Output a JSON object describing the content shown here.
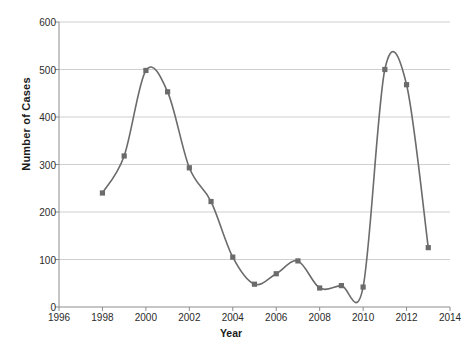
{
  "chart_data": {
    "type": "line",
    "title": "",
    "xlabel": "Year",
    "ylabel": "Number of Cases",
    "x": [
      1998,
      1999,
      2000,
      2001,
      2002,
      2003,
      2004,
      2005,
      2006,
      2007,
      2008,
      2009,
      2010,
      2011,
      2012,
      2013
    ],
    "values": [
      240,
      318,
      498,
      453,
      293,
      222,
      105,
      48,
      70,
      97,
      40,
      45,
      42,
      500,
      468,
      125
    ],
    "series": [
      {
        "name": "Number of Cases",
        "values": [
          240,
          318,
          498,
          453,
          293,
          222,
          105,
          48,
          70,
          97,
          40,
          45,
          42,
          500,
          468,
          125
        ]
      }
    ],
    "xlim": [
      1996,
      2014
    ],
    "ylim": [
      0,
      600
    ],
    "xticks": [
      1996,
      1998,
      2000,
      2002,
      2004,
      2006,
      2008,
      2010,
      2012,
      2014
    ],
    "xtick_labels": [
      "1996",
      "1998",
      "2000",
      "2002",
      "2004",
      "2006",
      "2008",
      "2010",
      "2012",
      "2014"
    ],
    "yticks": [
      0,
      100,
      200,
      300,
      400,
      500,
      600
    ],
    "ytick_labels": [
      "0",
      "100",
      "200",
      "300",
      "400",
      "500",
      "600"
    ],
    "grid": "horizontal",
    "legend": "none",
    "marker": "square",
    "smoothing": "spline",
    "colors": {
      "line": "#6b6b6b",
      "marker": "#6b6b6b",
      "grid": "#cfcfcf",
      "axis": "#8c8c8c",
      "text": "#2b2b2b",
      "background": "#ffffff"
    }
  }
}
